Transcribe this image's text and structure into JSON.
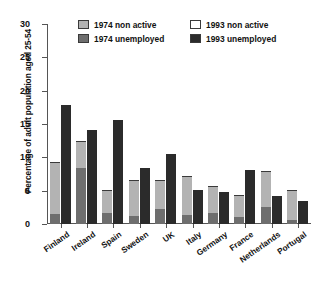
{
  "chart_data": {
    "type": "bar",
    "subtype": "grouped-stacked-bar",
    "title": "",
    "xlabel": "",
    "ylabel": "Percentage of adult population aged 25-54",
    "ylim": [
      0,
      30
    ],
    "yticks": [
      0,
      5,
      10,
      15,
      20,
      25,
      30
    ],
    "ytick_labels": [
      "0",
      "5",
      "10",
      "15",
      "20",
      "25",
      "30"
    ],
    "grid": false,
    "legend_position": "top-center",
    "categories": [
      "Finland",
      "Ireland",
      "Spain",
      "Sweden",
      "UK",
      "Italy",
      "Germany",
      "France",
      "Netherlands",
      "Portugal"
    ],
    "series": [
      {
        "name": "1974 unemployed",
        "color": "#6e6e6e",
        "group": "1974",
        "stack_order": 1,
        "values": [
          1.4,
          8.3,
          1.5,
          1.1,
          2.1,
          1.2,
          1.5,
          0.9,
          2.4,
          0.5
        ]
      },
      {
        "name": "1974 non active",
        "color": "#b3b3b3",
        "group": "1974",
        "stack_order": 2,
        "values": [
          7.7,
          4.0,
          3.4,
          5.4,
          4.3,
          5.9,
          4.1,
          3.3,
          5.4,
          4.5
        ]
      },
      {
        "name": "1993 unemployed",
        "color": "#2b2b2b",
        "group": "1993",
        "stack_order": 1,
        "values": [
          17.7,
          14.0,
          15.4,
          8.3,
          10.3,
          4.9,
          4.6,
          8.0,
          4.1,
          3.3
        ]
      },
      {
        "name": "1993 non active",
        "color": "#ffffff",
        "group": "1993",
        "stack_order": 2,
        "values": [
          9.0,
          8.9,
          7.3,
          8.7,
          6.6,
          11.1,
          10.0,
          5.1,
          6.5,
          6.1
        ]
      }
    ],
    "totals": {
      "1974": [
        9.1,
        12.3,
        4.9,
        6.5,
        6.4,
        7.1,
        5.6,
        4.2,
        7.8,
        5.0
      ],
      "1993": [
        26.7,
        22.9,
        22.7,
        17.0,
        16.9,
        16.0,
        14.6,
        13.1,
        10.6,
        9.4
      ]
    }
  },
  "legend": {
    "entries": [
      {
        "label": "1974 non active",
        "swatch": "light-gray-swatch"
      },
      {
        "label": "1993 non active",
        "swatch": "white-swatch"
      },
      {
        "label": "1974 unemployed",
        "swatch": "medium-gray-swatch"
      },
      {
        "label": "1993 unemployed",
        "swatch": "black-swatch"
      }
    ]
  },
  "colors": {
    "non_active_1974": "#b3b3b3",
    "unemployed_1974": "#6e6e6e",
    "non_active_1993": "#ffffff",
    "unemployed_1993": "#2b2b2b",
    "axis": "#555555",
    "text": "#111111"
  }
}
